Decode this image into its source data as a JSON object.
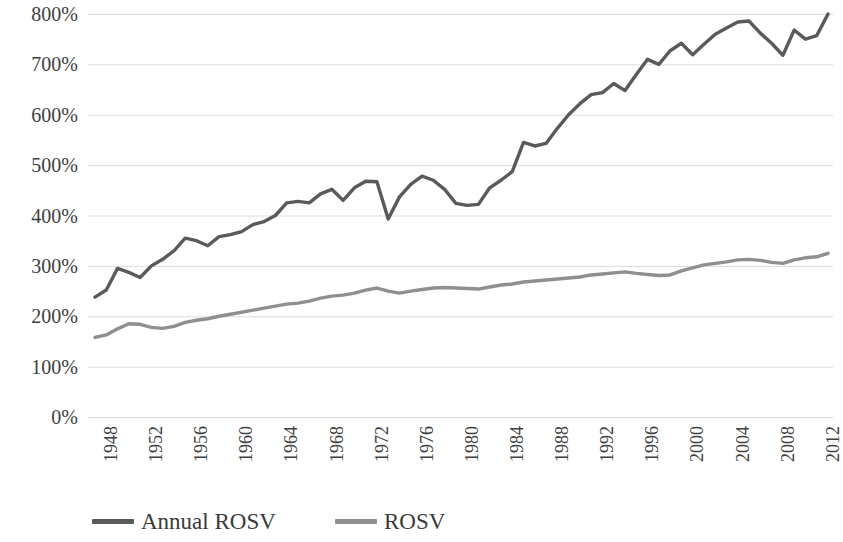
{
  "chart_data": {
    "type": "line",
    "title": "",
    "subtitle": "",
    "xlabel": "",
    "ylabel": "",
    "grid": true,
    "legend_position": "bottom",
    "xlim": [
      1948,
      2013
    ],
    "ylim": [
      0,
      800
    ],
    "y_tick_labels": [
      "800%",
      "700%",
      "600%",
      "500%",
      "400%",
      "300%",
      "200%",
      "100%",
      "0%"
    ],
    "y_tick_values": [
      800,
      700,
      600,
      500,
      400,
      300,
      200,
      100,
      0
    ],
    "x_tick_labels": [
      "1948",
      "1952",
      "1956",
      "1960",
      "1964",
      "1968",
      "1972",
      "1976",
      "1980",
      "1984",
      "1988",
      "1992",
      "1996",
      "2000",
      "2004",
      "2008",
      "2012"
    ],
    "x_tick_values": [
      1948,
      1952,
      1956,
      1960,
      1964,
      1968,
      1972,
      1976,
      1980,
      1984,
      1988,
      1992,
      1996,
      2000,
      2004,
      2008,
      2012
    ],
    "x": [
      1948,
      1949,
      1950,
      1951,
      1952,
      1953,
      1954,
      1955,
      1956,
      1957,
      1958,
      1959,
      1960,
      1961,
      1962,
      1963,
      1964,
      1965,
      1966,
      1967,
      1968,
      1969,
      1970,
      1971,
      1972,
      1973,
      1974,
      1975,
      1976,
      1977,
      1978,
      1979,
      1980,
      1981,
      1982,
      1983,
      1984,
      1985,
      1986,
      1987,
      1988,
      1989,
      1990,
      1991,
      1992,
      1993,
      1994,
      1995,
      1996,
      1997,
      1998,
      1999,
      2000,
      2001,
      2002,
      2003,
      2004,
      2005,
      2006,
      2007,
      2008,
      2009,
      2010,
      2011,
      2012,
      2013
    ],
    "series": [
      {
        "name": "Annual ROSV",
        "color": "#5a5a5a",
        "values": [
          238,
          252,
          295,
          287,
          277,
          300,
          313,
          330,
          355,
          350,
          340,
          358,
          362,
          368,
          382,
          388,
          400,
          425,
          428,
          425,
          443,
          452,
          430,
          455,
          468,
          467,
          393,
          437,
          462,
          478,
          470,
          452,
          424,
          420,
          422,
          455,
          470,
          487,
          545,
          538,
          543,
          573,
          600,
          622,
          640,
          644,
          662,
          648,
          680,
          710,
          700,
          727,
          742,
          719,
          740,
          760,
          772,
          784,
          786,
          762,
          742,
          718,
          768,
          750,
          757,
          800
        ]
      },
      {
        "name": "ROSV",
        "color": "#8f8f8f",
        "values": [
          158,
          163,
          175,
          185,
          184,
          178,
          176,
          180,
          188,
          192,
          195,
          200,
          204,
          208,
          212,
          216,
          220,
          224,
          226,
          230,
          236,
          240,
          242,
          246,
          252,
          256,
          250,
          246,
          250,
          253,
          256,
          257,
          256,
          255,
          254,
          258,
          262,
          264,
          268,
          270,
          272,
          274,
          276,
          278,
          282,
          284,
          286,
          288,
          285,
          283,
          281,
          282,
          290,
          296,
          302,
          305,
          308,
          312,
          313,
          311,
          307,
          305,
          312,
          316,
          318,
          325
        ]
      }
    ]
  },
  "legend": {
    "items": [
      {
        "label": "Annual ROSV",
        "color": "#5a5a5a"
      },
      {
        "label": "ROSV",
        "color": "#8f8f8f"
      }
    ]
  }
}
